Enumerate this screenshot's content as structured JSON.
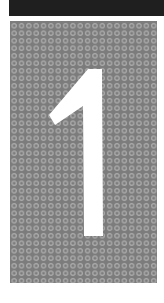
{
  "image": {
    "numeral": "1",
    "colors": {
      "top_band": "#1f1f1f",
      "panel_background": "#7c7c7c",
      "dot_ring": "#a9a9a9",
      "numeral_fill": "#ffffff",
      "page_background": "#ffffff"
    },
    "pattern": {
      "type": "ring-dot-grid",
      "columns": 20,
      "rows": 35
    }
  }
}
